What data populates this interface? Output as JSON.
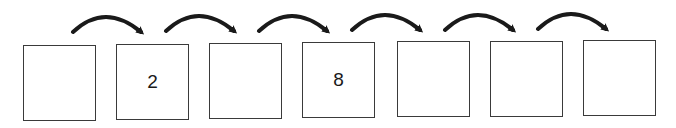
{
  "diagram": {
    "type": "number-sequence",
    "boxes": [
      {
        "value": ""
      },
      {
        "value": "2"
      },
      {
        "value": ""
      },
      {
        "value": "8"
      },
      {
        "value": ""
      },
      {
        "value": ""
      },
      {
        "value": ""
      }
    ],
    "arrow_count": 6,
    "colors": {
      "stroke": "#1a1a1a",
      "box_border": "#3a3a3a"
    }
  }
}
